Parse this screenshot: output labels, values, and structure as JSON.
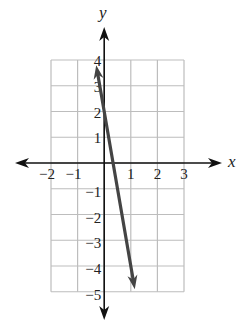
{
  "chart_data": {
    "type": "line",
    "title": "",
    "xlabel": "x",
    "ylabel": "y",
    "xlim": [
      -2,
      3
    ],
    "ylim": [
      -5,
      4
    ],
    "grid": true,
    "x_ticks": [
      -2,
      -1,
      1,
      2,
      3
    ],
    "y_ticks": [
      4,
      3,
      2,
      1,
      -1,
      -2,
      -3,
      -4,
      -5
    ],
    "x_tick_labels": [
      "−2",
      "−1",
      "1",
      "2",
      "3"
    ],
    "y_tick_labels": [
      "4",
      "3",
      "2",
      "1",
      "−1",
      "−2",
      "−3",
      "−4",
      "−5"
    ],
    "series": [
      {
        "name": "line",
        "equation": "y = -6x + 2",
        "x": [
          -0.3,
          1.15
        ],
        "y": [
          3.8,
          -4.9
        ],
        "arrows": "both",
        "color": "#444444"
      }
    ],
    "colors": {
      "axis": "#111111",
      "grid": "#bdbdbd",
      "line": "#444444"
    }
  }
}
